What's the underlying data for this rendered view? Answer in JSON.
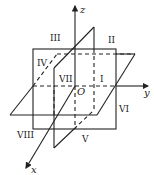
{
  "diagram": {
    "axes": {
      "x": "x",
      "y": "y",
      "z": "z",
      "origin": "O"
    },
    "octants": [
      "I",
      "II",
      "III",
      "IV",
      "V",
      "VI",
      "VII",
      "VIII"
    ],
    "colors": {
      "line": "#222222",
      "background": "#ffffff"
    }
  }
}
